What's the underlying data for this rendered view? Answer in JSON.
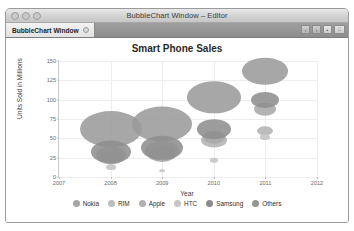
{
  "window": {
    "title": "BubbleChart Window – Editor",
    "traffic_lights": [
      "close-button",
      "minimize-button",
      "zoom-button"
    ],
    "tab": {
      "label": "BubbleChart Window",
      "close_icon": "close-icon"
    },
    "toolbar_buttons": [
      {
        "name": "back-button",
        "glyph": "‹"
      },
      {
        "name": "forward-button",
        "glyph": "›"
      },
      {
        "name": "layout-button",
        "glyph": "▪"
      },
      {
        "name": "panel-toggle-button",
        "glyph": "⎕"
      }
    ]
  },
  "chart_data": {
    "type": "scatter",
    "title": "Smart Phone Sales",
    "xlabel": "Year",
    "ylabel": "Units Sold in Millions",
    "xlim": [
      2007,
      2012
    ],
    "ylim": [
      0,
      150
    ],
    "xticks": [
      "2007",
      "2008",
      "2009",
      "2010",
      "2011",
      "2012"
    ],
    "yticks": [
      "0",
      "25",
      "50",
      "75",
      "100",
      "125",
      "150"
    ],
    "grid": true,
    "legend_position": "bottom",
    "series": [
      {
        "name": "Nokia",
        "color": "#9b9b9b",
        "points": [
          {
            "x": 2008,
            "y": 62,
            "r": 31
          },
          {
            "x": 2009,
            "y": 68,
            "r": 30
          },
          {
            "x": 2010,
            "y": 103,
            "r": 27
          },
          {
            "x": 2011,
            "y": 137,
            "r": 23
          }
        ]
      },
      {
        "name": "RIM",
        "color": "#b3b3b3",
        "points": [
          {
            "x": 2008,
            "y": 28,
            "r": 15
          },
          {
            "x": 2009,
            "y": 33,
            "r": 17
          },
          {
            "x": 2010,
            "y": 48,
            "r": 13
          },
          {
            "x": 2011,
            "y": 60,
            "r": 8
          }
        ]
      },
      {
        "name": "Apple",
        "color": "#a8a8a8",
        "points": [
          {
            "x": 2008,
            "y": 25,
            "r": 11
          },
          {
            "x": 2009,
            "y": 30,
            "r": 14
          },
          {
            "x": 2010,
            "y": 52,
            "r": 11
          },
          {
            "x": 2011,
            "y": 88,
            "r": 11
          }
        ]
      },
      {
        "name": "HTC",
        "color": "#c4c4c4",
        "points": [
          {
            "x": 2008,
            "y": 13,
            "r": 5
          },
          {
            "x": 2009,
            "y": 8,
            "r": 3
          },
          {
            "x": 2010,
            "y": 22,
            "r": 4
          },
          {
            "x": 2011,
            "y": 52,
            "r": 5
          }
        ]
      },
      {
        "name": "Samsung",
        "color": "#8e8e8e",
        "points": [
          {
            "x": 2008,
            "y": 32,
            "r": 20
          },
          {
            "x": 2009,
            "y": 38,
            "r": 21
          },
          {
            "x": 2010,
            "y": 62,
            "r": 17
          },
          {
            "x": 2011,
            "y": 100,
            "r": 14
          }
        ]
      },
      {
        "name": "Others",
        "color": "#9a9a9a",
        "points": []
      }
    ],
    "legend": [
      {
        "label": "Nokia",
        "color": "#a6a6a6"
      },
      {
        "label": "RIM",
        "color": "#bdbdbd"
      },
      {
        "label": "Apple",
        "color": "#b0b0b0"
      },
      {
        "label": "HTC",
        "color": "#c6c6c6"
      },
      {
        "label": "Samsung",
        "color": "#8c8c8c"
      },
      {
        "label": "Others",
        "color": "#949494"
      }
    ]
  }
}
